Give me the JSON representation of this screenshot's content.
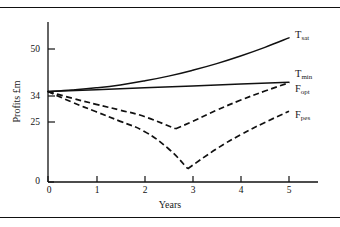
{
  "chart_data": {
    "type": "line",
    "title": "",
    "xlabel": "Years",
    "ylabel": "Profits £m",
    "xlim": [
      0,
      5.8
    ],
    "ylim": [
      0,
      62
    ],
    "grid": false,
    "legend_position": "right-inline",
    "xticks": [
      0,
      1,
      2,
      3,
      4,
      5
    ],
    "xtick_labels": [
      "0",
      "1",
      "2",
      "3",
      "4",
      "5"
    ],
    "yticks": [
      0,
      25,
      34,
      50
    ],
    "ytick_labels": [
      "0",
      "25",
      "34",
      "50"
    ],
    "series": [
      {
        "name": "T_sat",
        "label_text": "T",
        "label_sub": "sat",
        "style": "solid",
        "x": [
          0,
          0.5,
          1,
          1.5,
          2,
          2.5,
          3,
          3.5,
          4,
          4.5,
          5
        ],
        "values": [
          34,
          34.6,
          35.4,
          36.5,
          38.0,
          39.8,
          42.0,
          44.5,
          47.4,
          50.6,
          54.2
        ]
      },
      {
        "name": "T_min",
        "label_text": "T",
        "label_sub": "min",
        "style": "solid",
        "x": [
          0,
          1,
          2,
          3,
          4,
          5
        ],
        "values": [
          34,
          34.7,
          35.4,
          36.1,
          36.8,
          37.5
        ]
      },
      {
        "name": "F_opt",
        "label_text": "F",
        "label_sub": "opt",
        "style": "dashed",
        "x": [
          0,
          0.5,
          1,
          1.5,
          2,
          2.65,
          3,
          3.5,
          4,
          4.5,
          5
        ],
        "values": [
          34,
          31.5,
          29.2,
          27.0,
          24.6,
          20.0,
          22.8,
          27.0,
          30.8,
          34.2,
          37.3
        ]
      },
      {
        "name": "F_pes",
        "label_text": "F",
        "label_sub": "pes",
        "style": "dashed",
        "x": [
          0,
          0.5,
          1,
          1.5,
          2,
          2.5,
          2.9,
          3.5,
          4,
          4.5,
          5
        ],
        "values": [
          34,
          30.0,
          26.4,
          22.8,
          19.0,
          12.5,
          5.0,
          12.5,
          17.8,
          22.4,
          26.6
        ]
      }
    ]
  },
  "axis": {
    "y_title": "Profits £m",
    "x_title": "Years",
    "y_tick_0": "0",
    "y_tick_25": "25",
    "y_tick_34": "34",
    "y_tick_50": "50",
    "x_tick_0": "0",
    "x_tick_1": "1",
    "x_tick_2": "2",
    "x_tick_3": "3",
    "x_tick_4": "4",
    "x_tick_5": "5"
  },
  "labels": {
    "tsat_main": "T",
    "tsat_sub": "sat",
    "tmin_main": "T",
    "tmin_sub": "min",
    "fopt_main": "F",
    "fopt_sub": "opt",
    "fpes_main": "F",
    "fpes_sub": "pes"
  },
  "colors": {
    "ink": "#111111",
    "background": "#ffffff"
  }
}
